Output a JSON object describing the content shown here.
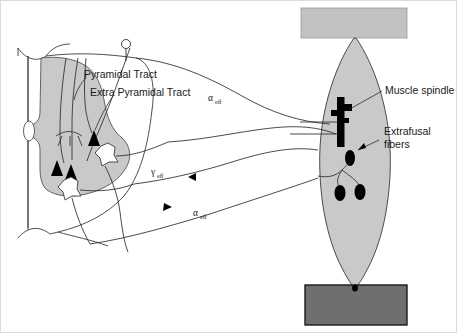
{
  "figure": {
    "background": "#ffffff",
    "border_color": "#d8d8d8",
    "width": 457,
    "height": 333
  },
  "colors": {
    "gray_matter": "#c9c9c9",
    "muscle_body": "#c9c9c9",
    "tendon_top": "#c2c2c2",
    "bone_bottom": "#6f6f6f",
    "bone_border": "#1a1a1a",
    "outline": "#3b3b3b",
    "neuron_black": "#000000",
    "text": "#1a1a1a"
  },
  "labels": {
    "pyramidal_tract": "Pyramidal Tract",
    "extra_pyramidal_tract": "Extra Pyramidal Tract",
    "muscle_spindle": "Muscle spindle",
    "extrafusal_fibers_line1": "Extrafusal",
    "extrafusal_fibers_line2": "fibers",
    "alpha_efferent_upper": {
      "symbol": "α",
      "subscript": "eff"
    },
    "gamma_efferent": {
      "symbol": "γ",
      "subscript": "eff"
    },
    "alpha_efferent_lower": {
      "symbol": "α",
      "subscript": "eff"
    }
  },
  "structures": {
    "spinal_cord": "spinal-cord-cross-section",
    "gray_matter": "butterfly-gray-matter",
    "motor_neurons": "star-shaped-motor-neuron-somas",
    "synaptic_terminals": "filled-triangle-synaptic-boutons",
    "descending_neuron_soma": "small-circle-cortical-neuron",
    "muscle": "spindle-shaped-skeletal-muscle",
    "spindle_organ": "intrafusal-fiber-bundle-black",
    "extrafusal_units": "black-teardrop-motor-endplates",
    "tendon_attachment_top": "tendon-block",
    "bone_attachment_bottom": "bone-block"
  }
}
